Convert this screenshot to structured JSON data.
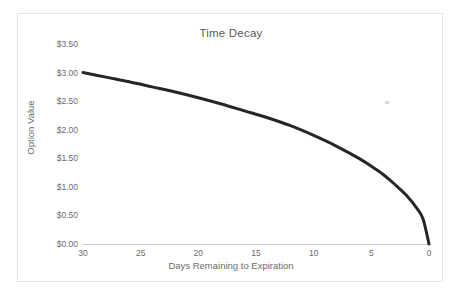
{
  "chart_data": {
    "type": "line",
    "title": "Time Decay",
    "xlabel": "Days Remaining to Expiration",
    "ylabel": "Option Value",
    "xlim": [
      30,
      0
    ],
    "ylim": [
      0.0,
      3.5
    ],
    "x_reversed": true,
    "grid": false,
    "legend": "none",
    "xticks": [
      30,
      25,
      20,
      15,
      10,
      5,
      0
    ],
    "xtick_labels": [
      "30",
      "25",
      "20",
      "15",
      "10",
      "5",
      "0"
    ],
    "yticks": [
      0.0,
      0.5,
      1.0,
      1.5,
      2.0,
      2.5,
      3.0,
      3.5
    ],
    "ytick_labels": [
      "$0.00",
      "$0.50",
      "$1.00",
      "$1.50",
      "$2.00",
      "$2.50",
      "$3.00",
      "$3.50"
    ],
    "line_color": "#262626",
    "line_width": 3,
    "series": [
      {
        "name": "Option Value",
        "x": [
          30,
          28,
          26,
          24,
          22,
          20,
          18,
          16,
          14,
          12,
          10,
          8,
          6,
          5,
          4,
          3,
          2,
          1,
          0.5,
          0
        ],
        "values": [
          3.0,
          2.92,
          2.84,
          2.75,
          2.66,
          2.56,
          2.45,
          2.33,
          2.21,
          2.07,
          1.9,
          1.71,
          1.49,
          1.36,
          1.22,
          1.05,
          0.86,
          0.61,
          0.43,
          0.0
        ]
      }
    ]
  },
  "annotations": {
    "stray_mark": ""
  }
}
